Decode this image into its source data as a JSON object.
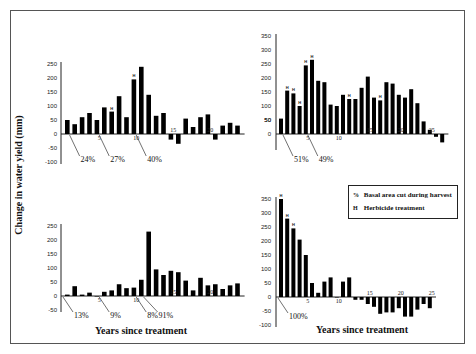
{
  "figure": {
    "ylabel": "Change in water yield (mm)",
    "xlabel": "Years since treatment",
    "legend": {
      "items": [
        {
          "marker": "%",
          "label": "Basal area cut during harvest"
        },
        {
          "marker": "H",
          "label": "Herbicide treatment"
        }
      ]
    }
  },
  "chart_data": [
    {
      "type": "bar",
      "panel": "top-left",
      "xlabel": "",
      "ylabel": "Change in water yield (mm)",
      "ylim": [
        -100,
        250
      ],
      "yticks": [
        250,
        200,
        150,
        100,
        50,
        0,
        -50,
        -100
      ],
      "xticks": [
        5,
        10,
        15,
        20
      ],
      "x": [
        1,
        2,
        3,
        4,
        5,
        6,
        7,
        8,
        9,
        10,
        11,
        12,
        13,
        14,
        15,
        16,
        17,
        18,
        19,
        20,
        21,
        22,
        23,
        24
      ],
      "values": [
        50,
        35,
        60,
        75,
        50,
        95,
        80,
        135,
        60,
        195,
        240,
        140,
        65,
        75,
        -20,
        -35,
        55,
        25,
        60,
        70,
        -20,
        30,
        40,
        30
      ],
      "herbicide_years": [
        7,
        10
      ],
      "annotations": [
        {
          "label": "24%",
          "year": 1
        },
        {
          "label": "27%",
          "year": 5
        },
        {
          "label": "40%",
          "year": 10
        }
      ]
    },
    {
      "type": "bar",
      "panel": "top-right",
      "xlabel": "",
      "ylabel": "Change in water yield (mm)",
      "ylim": [
        -50,
        350
      ],
      "yticks": [
        350,
        300,
        250,
        200,
        150,
        100,
        50,
        0,
        50
      ],
      "xticks": [
        5,
        10,
        15,
        20,
        25
      ],
      "x": [
        1,
        2,
        3,
        4,
        5,
        6,
        7,
        8,
        9,
        10,
        11,
        12,
        13,
        14,
        15,
        16,
        17,
        18,
        19,
        20,
        21,
        22,
        23,
        24,
        25,
        26
      ],
      "values": [
        55,
        155,
        145,
        100,
        245,
        265,
        190,
        185,
        105,
        100,
        140,
        125,
        125,
        165,
        205,
        130,
        120,
        185,
        180,
        140,
        130,
        160,
        110,
        45,
        15,
        -10,
        -30
      ],
      "herbicide_years": [
        2,
        3,
        4,
        5,
        6,
        12,
        17
      ],
      "annotations": [
        {
          "label": "51%",
          "year": 1
        },
        {
          "label": "49%",
          "year": 5
        }
      ]
    },
    {
      "type": "bar",
      "panel": "bottom-left",
      "xlabel": "Years since treatment",
      "ylabel": "Change in water yield (mm)",
      "ylim": [
        -50,
        250
      ],
      "yticks": [
        250,
        200,
        150,
        100,
        50,
        0,
        -50
      ],
      "xticks": [
        5,
        10,
        15,
        20
      ],
      "x": [
        1,
        2,
        3,
        4,
        5,
        6,
        7,
        8,
        9,
        10,
        11,
        12,
        13,
        14,
        15,
        16,
        17,
        18,
        19,
        20,
        21,
        22,
        23,
        24
      ],
      "values": [
        5,
        35,
        5,
        12,
        0,
        15,
        20,
        42,
        28,
        30,
        58,
        230,
        95,
        75,
        90,
        85,
        55,
        20,
        65,
        38,
        42,
        25,
        38,
        45
      ],
      "herbicide_years": [],
      "annotations": [
        {
          "label": "13%",
          "year": 0
        },
        {
          "label": "9%",
          "year": 5
        },
        {
          "label": "8%",
          "year": 10
        },
        {
          "label": "91%",
          "year": 11
        }
      ]
    },
    {
      "type": "bar",
      "panel": "bottom-right",
      "xlabel": "Years since treatment",
      "ylabel": "Change in water yield (mm)",
      "ylim": [
        -100,
        350
      ],
      "yticks": [
        350,
        300,
        250,
        200,
        150,
        100,
        50,
        0,
        -50,
        -100
      ],
      "xticks": [
        5,
        10,
        15,
        20,
        25
      ],
      "x": [
        1,
        2,
        3,
        4,
        5,
        6,
        7,
        8,
        9,
        10,
        11,
        12,
        13,
        14,
        15,
        16,
        17,
        18,
        19,
        20,
        21,
        22,
        23,
        24,
        25
      ],
      "values": [
        350,
        280,
        245,
        205,
        150,
        50,
        15,
        55,
        70,
        0,
        55,
        70,
        -10,
        -10,
        -25,
        -35,
        -60,
        -55,
        -55,
        -40,
        -70,
        -70,
        -45,
        -25,
        -40
      ],
      "herbicide_years": [
        1,
        2,
        3
      ],
      "annotations": [
        {
          "label": "100%",
          "year": 0
        }
      ]
    }
  ]
}
